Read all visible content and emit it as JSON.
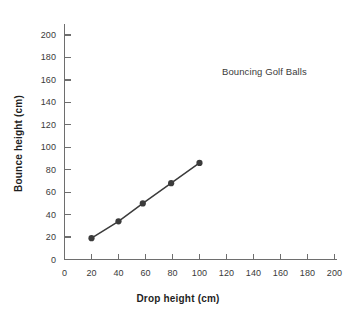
{
  "chart_data": {
    "type": "line",
    "title": "Bouncing Golf Balls",
    "xlabel": "Drop height (cm)",
    "ylabel": "Bounce height (cm)",
    "xlim": [
      0,
      200
    ],
    "ylim": [
      0,
      210
    ],
    "grid": false,
    "legend": null,
    "xticks": [
      0,
      20,
      40,
      60,
      80,
      100,
      120,
      140,
      160,
      180,
      200
    ],
    "xtick_labels": [
      "0",
      "20",
      "40",
      "60",
      "80",
      "100",
      "120",
      "140",
      "160",
      "180",
      "200"
    ],
    "yticks": [
      0,
      20,
      40,
      60,
      80,
      100,
      120,
      140,
      160,
      180,
      200
    ],
    "ytick_labels": [
      "0",
      "20",
      "40",
      "60",
      "80",
      "100",
      "120",
      "140",
      "160",
      "180",
      "200"
    ],
    "series": [
      {
        "name": "Bouncing Golf Balls",
        "marker": "circle",
        "color": "#3b3b3b",
        "points": [
          {
            "x": 20,
            "y": 19
          },
          {
            "x": 40,
            "y": 34
          },
          {
            "x": 58,
            "y": 50
          },
          {
            "x": 79,
            "y": 68
          },
          {
            "x": 100,
            "y": 86
          }
        ]
      }
    ],
    "axis_color": "#6e6e6e",
    "text_color": "#3a3a3a"
  }
}
